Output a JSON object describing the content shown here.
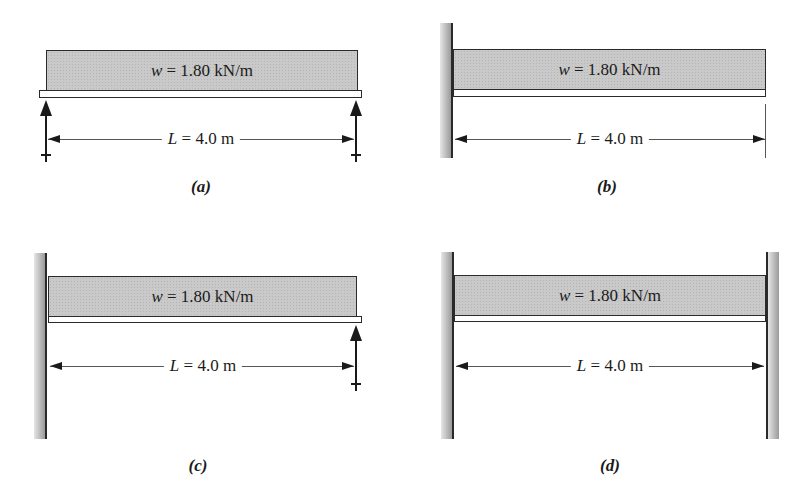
{
  "figure": {
    "panels": [
      {
        "id": "a",
        "caption": "(a)",
        "support_type": "simply supported",
        "load": {
          "var": "w",
          "text": " = 1.80 kN/m"
        },
        "span": {
          "var": "L",
          "text": " = 4.0 m"
        }
      },
      {
        "id": "b",
        "caption": "(b)",
        "support_type": "cantilever (fixed left end)",
        "load": {
          "var": "w",
          "text": " = 1.80 kN/m"
        },
        "span": {
          "var": "L",
          "text": " = 4.0 m"
        }
      },
      {
        "id": "c",
        "caption": "(c)",
        "support_type": "propped cantilever (fixed left, roller right)",
        "load": {
          "var": "w",
          "text": " = 1.80 kN/m"
        },
        "span": {
          "var": "L",
          "text": " = 4.0 m"
        }
      },
      {
        "id": "d",
        "caption": "(d)",
        "support_type": "fixed-fixed",
        "load": {
          "var": "w",
          "text": " = 1.80 kN/m"
        },
        "span": {
          "var": "L",
          "text": " = 4.0 m"
        }
      }
    ]
  }
}
